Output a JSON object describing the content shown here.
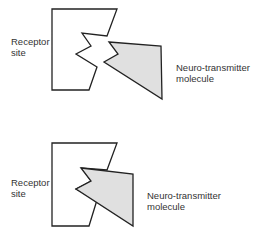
{
  "panels": [
    {
      "state": "unbound",
      "receptor_label_line1": "Receptor",
      "receptor_label_line2": "site",
      "molecule_label_line1": "Neuro-transmitter",
      "molecule_label_line2": "molecule"
    },
    {
      "state": "bound",
      "receptor_label_line1": "Receptor",
      "receptor_label_line2": "site",
      "molecule_label_line1": "Neuro-transmitter",
      "molecule_label_line2": "molecule"
    }
  ],
  "colors": {
    "stroke": "#222222",
    "molecule_fill": "#e0e0e0",
    "background": "#ffffff"
  }
}
